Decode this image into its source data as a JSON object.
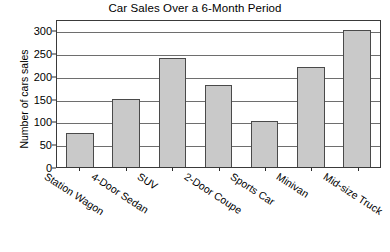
{
  "chart_data": {
    "type": "bar",
    "title": "Car Sales Over a 6-Month Period",
    "xlabel": "",
    "ylabel": "Number of cars sales",
    "categories": [
      "Station Wagon",
      "4-Door Sedan",
      "SUV",
      "2-Door Coupe",
      "Sports Car",
      "Minivan",
      "Mid-size Truck"
    ],
    "values": [
      75,
      150,
      240,
      180,
      100,
      220,
      300
    ],
    "ylim": [
      0,
      325
    ],
    "yticks": [
      0,
      50,
      100,
      150,
      200,
      250,
      300
    ],
    "ytick_labels": [
      "0",
      "50",
      "100",
      "150",
      "200",
      "250",
      "300"
    ],
    "grid": "horizontal",
    "legend": "none",
    "bar_color": "#c9c9c9",
    "bar_edge_color": "#4a4a4a",
    "background_color": "#ffffff",
    "axis_color": "#3a3a3a"
  }
}
